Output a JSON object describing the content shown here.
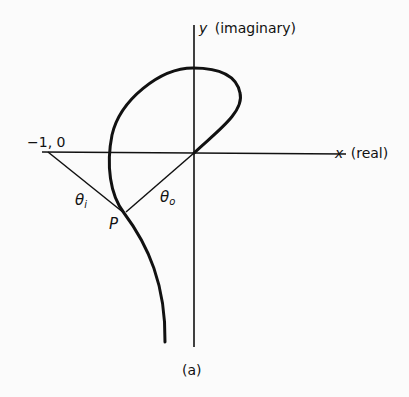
{
  "figure": {
    "caption": "(a)",
    "axes": {
      "x_label_var": "x",
      "x_label_text": "(real)",
      "y_label_var": "y",
      "y_label_text": "(imaginary)"
    },
    "points": {
      "critical_point": "−1, 0",
      "P": "P"
    },
    "angles": {
      "theta_i": "θ",
      "theta_i_sub": "i",
      "theta_o": "θ",
      "theta_o_sub": "o"
    },
    "colors": {
      "ink": "#111111",
      "background": "#fbfbfb"
    }
  }
}
